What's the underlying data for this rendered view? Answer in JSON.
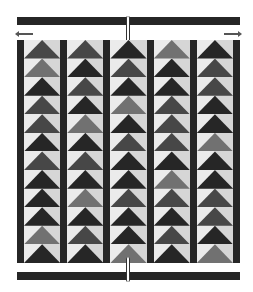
{
  "diagram": {
    "type": "flying-geese-quilt",
    "columns": 5,
    "rows_per_column": 12,
    "palette": {
      "D": "#262626",
      "M": "#474747",
      "L": "#717171",
      "background_light": "#ebebeb",
      "background_shade": "#d6d6d6",
      "sashing": "#262626"
    },
    "column_shades": [
      [
        "M",
        "L",
        "D",
        "M",
        "M",
        "D",
        "M",
        "D",
        "D",
        "D",
        "L",
        "D"
      ],
      [
        "M",
        "D",
        "M",
        "D",
        "L",
        "D",
        "M",
        "D",
        "L",
        "D",
        "M",
        "D"
      ],
      [
        "D",
        "M",
        "D",
        "L",
        "D",
        "M",
        "D",
        "D",
        "M",
        "D",
        "D",
        "L"
      ],
      [
        "L",
        "D",
        "D",
        "M",
        "M",
        "M",
        "D",
        "L",
        "M",
        "D",
        "M",
        "D"
      ],
      [
        "D",
        "M",
        "M",
        "D",
        "D",
        "L",
        "D",
        "D",
        "M",
        "M",
        "D",
        "L"
      ]
    ],
    "annotations": {
      "top_border": "dark-strip",
      "bottom_border": "dark-strip",
      "center_marker": "vertical-notch",
      "left_arrow": "arrow-left",
      "right_arrow": "arrow-right"
    }
  }
}
